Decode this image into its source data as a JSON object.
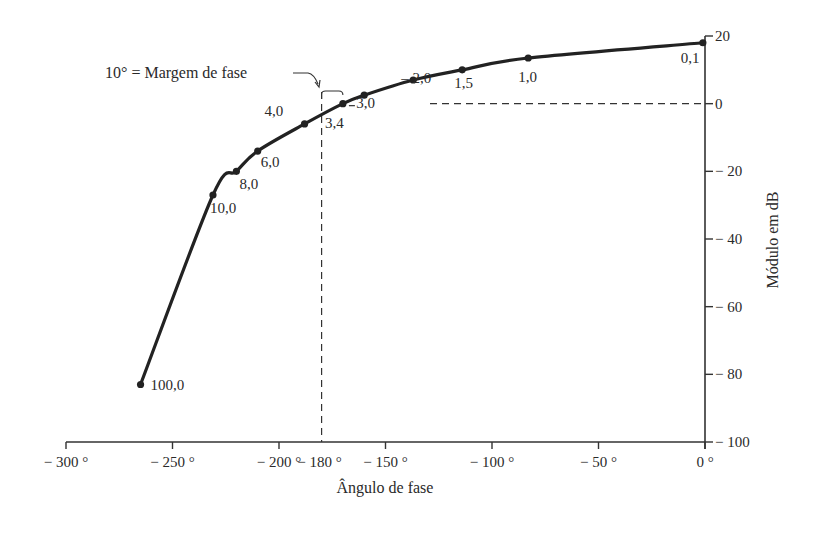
{
  "chart_data": {
    "type": "line",
    "title": "",
    "xlabel": "Ângulo de fase",
    "ylabel": "Módulo em dB",
    "xlim": [
      -300,
      0
    ],
    "ylim": [
      -100,
      20
    ],
    "grid": false,
    "legend": null,
    "x_ticks": [
      -300,
      -250,
      -200,
      -180,
      -150,
      -100,
      -50,
      0
    ],
    "x_tick_labels": [
      "− 300 °",
      "− 250 °",
      "− 200 °",
      "− 180 °",
      "− 150 °",
      "− 100 °",
      "− 50 °",
      "0 °"
    ],
    "y_ticks": [
      20,
      0,
      -20,
      -40,
      -60,
      -80,
      -100
    ],
    "y_tick_labels": [
      "20",
      "0",
      "− 20",
      "− 40",
      "− 60",
      "− 80",
      "− 100"
    ],
    "series": [
      {
        "name": "Diagrama de Nichols (log-módulo vs fase)",
        "points": [
          {
            "label": "0,1",
            "phase": -1,
            "db": 18
          },
          {
            "label": "1,0",
            "phase": -83,
            "db": 13.5
          },
          {
            "label": "1,5",
            "phase": -114,
            "db": 10
          },
          {
            "label": "2,0",
            "phase": -137,
            "db": 7
          },
          {
            "label": "3,0",
            "phase": -160,
            "db": 2.5
          },
          {
            "label": "3,4",
            "phase": -170,
            "db": 0
          },
          {
            "label": "4,0",
            "phase": -188,
            "db": -6
          },
          {
            "label": "6,0",
            "phase": -210,
            "db": -14
          },
          {
            "label": "8,0",
            "phase": -220,
            "db": -20
          },
          {
            "label": "10,0",
            "phase": -231,
            "db": -27
          },
          {
            "label": "100,0",
            "phase": -265,
            "db": -83
          }
        ]
      }
    ],
    "annotations": [
      {
        "text": "10° = Margem de fase",
        "target_phase": -180,
        "target_db": 0
      },
      {
        "type": "dashed-vertical",
        "phase": -180
      },
      {
        "type": "dashed-horizontal",
        "db": 0
      }
    ]
  },
  "labels": {
    "annotation": "10° = Margem de fase",
    "xlabel": "Ângulo de fase",
    "ylabel": "Módulo em dB"
  }
}
